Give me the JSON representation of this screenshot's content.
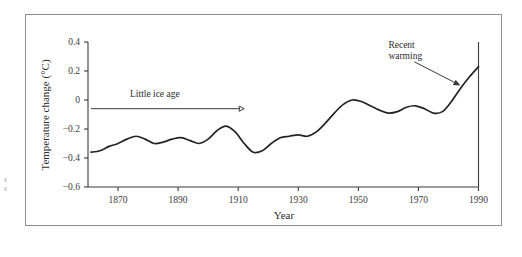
{
  "chart_data": {
    "type": "line",
    "title": "",
    "xlabel": "Year",
    "ylabel": "Temperature change (°C)",
    "xlim": [
      1860,
      1990
    ],
    "ylim": [
      -0.6,
      0.4
    ],
    "xticks": [
      1870,
      1890,
      1910,
      1930,
      1950,
      1970,
      1990
    ],
    "xticklabels": [
      "1870",
      "1890",
      "1910",
      "1930",
      "1950",
      "1970",
      "1990"
    ],
    "yticks": [
      -0.6,
      -0.4,
      -0.2,
      0,
      0.2,
      0.4
    ],
    "yticklabels": [
      "−0.6",
      "−0.4",
      "−0.2",
      "0",
      "0.2",
      "0.4"
    ],
    "grid": false,
    "legend": false,
    "series": [
      {
        "name": "Global temperature change",
        "color": "#232323",
        "x": [
          1861,
          1864,
          1867,
          1870,
          1873,
          1876,
          1879,
          1882,
          1885,
          1888,
          1891,
          1894,
          1897,
          1900,
          1903,
          1906,
          1909,
          1912,
          1915,
          1918,
          1921,
          1924,
          1927,
          1930,
          1933,
          1936,
          1939,
          1942,
          1945,
          1948,
          1951,
          1954,
          1957,
          1960,
          1963,
          1966,
          1969,
          1972,
          1975,
          1978,
          1981,
          1984,
          1987,
          1990
        ],
        "values": [
          -0.36,
          -0.35,
          -0.32,
          -0.3,
          -0.27,
          -0.25,
          -0.27,
          -0.3,
          -0.29,
          -0.27,
          -0.26,
          -0.28,
          -0.3,
          -0.27,
          -0.21,
          -0.18,
          -0.22,
          -0.3,
          -0.36,
          -0.35,
          -0.3,
          -0.26,
          -0.25,
          -0.24,
          -0.25,
          -0.22,
          -0.16,
          -0.09,
          -0.03,
          0.0,
          -0.01,
          -0.04,
          -0.07,
          -0.09,
          -0.08,
          -0.05,
          -0.04,
          -0.06,
          -0.09,
          -0.08,
          -0.01,
          0.08,
          0.16,
          0.23
        ]
      }
    ],
    "annotations": [
      {
        "name": "little-ice-age",
        "text": "Little  ice  age",
        "text_x": 1874,
        "text_y": 0.02,
        "arrow_from_year": 1861,
        "arrow_to_year": 1912,
        "arrow_y": -0.06
      },
      {
        "name": "recent-warming",
        "text_line1": "Recent",
        "text_line2": "warming",
        "text_x": 1960,
        "text_y": 0.36,
        "arrow_to_year": 1984,
        "arrow_to_value": 0.1
      }
    ]
  },
  "figure": {
    "caption": ""
  }
}
